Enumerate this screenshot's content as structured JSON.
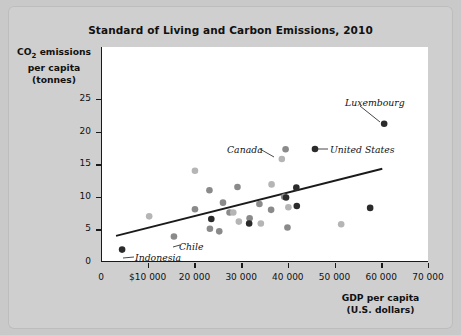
{
  "chart_data": {
    "type": "scatter",
    "title": "Standard of Living and Carbon Emissions, 2010",
    "xlabel": "GDP per capita\n(U.S. dollars)",
    "xlabel_line1": "GDP per capita",
    "xlabel_line2": "(U.S. dollars)",
    "ylabel_line1": "CO2 emissions",
    "ylabel_line2": "per capita",
    "ylabel_line3": "(tonnes)",
    "xlim": [
      0,
      70000
    ],
    "ylim": [
      0,
      27.5
    ],
    "grid": false,
    "legend": "none",
    "x_ticks": [
      0,
      10000,
      20000,
      30000,
      40000,
      50000,
      60000,
      70000
    ],
    "x_tick_labels": [
      "0",
      "$10 000",
      "20 000",
      "30 000",
      "40 000",
      "50 000",
      "60 000",
      "70 000"
    ],
    "y_ticks": [
      0,
      5,
      10,
      15,
      20,
      25
    ],
    "y_tick_labels": [
      "0",
      "5",
      "10",
      "15",
      "20",
      "25"
    ],
    "trendline": {
      "x0": 3000,
      "y0": 4.0,
      "x1": 60000,
      "y1": 14.3,
      "color": "#1a1a1a"
    },
    "point_colors": {
      "dark": "#2b2b2b",
      "medium": "#8a8a8a",
      "light": "#b5b5b5"
    },
    "points": [
      {
        "x": 4300,
        "y": 1.9,
        "shade": "dark",
        "label": "Indonesia"
      },
      {
        "x": 10100,
        "y": 7.0,
        "shade": "light",
        "label": ""
      },
      {
        "x": 15400,
        "y": 3.9,
        "shade": "medium",
        "label": "Chile"
      },
      {
        "x": 19900,
        "y": 14.0,
        "shade": "light",
        "label": ""
      },
      {
        "x": 19900,
        "y": 8.1,
        "shade": "medium",
        "label": ""
      },
      {
        "x": 23100,
        "y": 5.1,
        "shade": "medium",
        "label": ""
      },
      {
        "x": 23000,
        "y": 11.0,
        "shade": "medium",
        "label": ""
      },
      {
        "x": 23400,
        "y": 6.6,
        "shade": "dark",
        "label": ""
      },
      {
        "x": 25100,
        "y": 4.7,
        "shade": "medium",
        "label": ""
      },
      {
        "x": 25900,
        "y": 9.1,
        "shade": "medium",
        "label": ""
      },
      {
        "x": 27300,
        "y": 7.6,
        "shade": "medium",
        "label": ""
      },
      {
        "x": 28100,
        "y": 7.6,
        "shade": "light",
        "label": ""
      },
      {
        "x": 29000,
        "y": 11.5,
        "shade": "medium",
        "label": ""
      },
      {
        "x": 29300,
        "y": 6.2,
        "shade": "light",
        "label": ""
      },
      {
        "x": 31600,
        "y": 6.7,
        "shade": "medium",
        "label": ""
      },
      {
        "x": 31500,
        "y": 5.9,
        "shade": "dark",
        "label": ""
      },
      {
        "x": 33700,
        "y": 8.9,
        "shade": "medium",
        "label": ""
      },
      {
        "x": 34000,
        "y": 5.9,
        "shade": "light",
        "label": ""
      },
      {
        "x": 36300,
        "y": 11.9,
        "shade": "light",
        "label": ""
      },
      {
        "x": 36200,
        "y": 8.0,
        "shade": "medium",
        "label": ""
      },
      {
        "x": 38500,
        "y": 15.8,
        "shade": "light",
        "label": "Canada"
      },
      {
        "x": 39300,
        "y": 17.3,
        "shade": "medium",
        "label": ""
      },
      {
        "x": 39000,
        "y": 10.0,
        "shade": "medium",
        "label": ""
      },
      {
        "x": 39400,
        "y": 9.9,
        "shade": "dark",
        "label": ""
      },
      {
        "x": 39900,
        "y": 8.4,
        "shade": "light",
        "label": ""
      },
      {
        "x": 39700,
        "y": 5.3,
        "shade": "medium",
        "label": ""
      },
      {
        "x": 41600,
        "y": 11.4,
        "shade": "dark",
        "label": ""
      },
      {
        "x": 41700,
        "y": 8.6,
        "shade": "dark",
        "label": "United States"
      },
      {
        "x": 51200,
        "y": 5.8,
        "shade": "light",
        "label": ""
      },
      {
        "x": 57400,
        "y": 8.3,
        "shade": "dark",
        "label": ""
      },
      {
        "x": 60400,
        "y": 21.2,
        "shade": "dark",
        "label": "Luxembourg"
      }
    ],
    "annotations": [
      {
        "name": "luxembourg",
        "text": "Luxembourg",
        "label_x": 337,
        "label_y": 91,
        "leader": true
      },
      {
        "name": "canada",
        "text": "Canada",
        "label_x": 219,
        "label_y": 138,
        "leader": true
      },
      {
        "name": "united-states",
        "text": "United States",
        "label_x": 322,
        "label_y": 138,
        "leader": true
      },
      {
        "name": "chile",
        "text": "Chile",
        "label_x": 171,
        "label_y": 235,
        "leader": true
      },
      {
        "name": "indonesia",
        "text": "Indonesia",
        "label_x": 127,
        "label_y": 246,
        "leader": true
      }
    ]
  }
}
